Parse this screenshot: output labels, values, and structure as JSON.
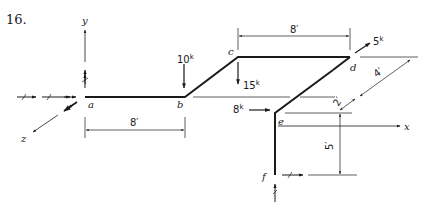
{
  "problem_number": "16.",
  "nodes": {
    "a": "a",
    "b": "b",
    "c": "c",
    "d": "d",
    "e": "e",
    "f": "f"
  },
  "axes": {
    "x": "x",
    "y": "y",
    "z": "z"
  },
  "loads": [
    {
      "id": "load_b",
      "value": "10",
      "unit": "k",
      "at": "b",
      "direction": "down"
    },
    {
      "id": "load_c",
      "value": "15",
      "unit": "k",
      "at": "c",
      "direction": "down"
    },
    {
      "id": "load_d",
      "value": "5",
      "unit": "k",
      "at": "d",
      "direction": "diagonal-up-right"
    },
    {
      "id": "load_e",
      "value": "8",
      "unit": "k",
      "at": "e",
      "direction": "right"
    }
  ],
  "dimensions": [
    {
      "id": "dim_ab",
      "label": "8′",
      "between": "a-b"
    },
    {
      "id": "dim_cd",
      "label": "8′",
      "between": "c-d"
    },
    {
      "id": "dim_diag_4",
      "label": "4′",
      "between": "d-x-axis"
    },
    {
      "id": "dim_diag_2",
      "label": "2′",
      "between": "x-axis-e"
    },
    {
      "id": "dim_ef",
      "label": "5′",
      "between": "e-f"
    }
  ],
  "colors": {
    "ink": "#1a1a1a",
    "background": "#ffffff"
  }
}
